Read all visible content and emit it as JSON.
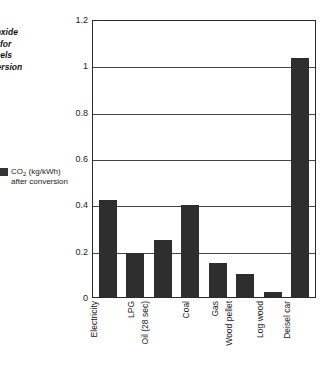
{
  "chart_data": {
    "type": "bar",
    "title": "Carbon dioxide emissions for different fuels after conversion",
    "xlabel": "",
    "ylabel": "",
    "ylim": [
      0,
      1.2
    ],
    "yticks": [
      "0",
      "0.2",
      "0.4",
      "0.6",
      "0.8",
      "1",
      "1.2"
    ],
    "ytick_values": [
      0,
      0.2,
      0.4,
      0.6,
      0.8,
      1,
      1.2
    ],
    "grid": "horizontal",
    "legend_position": "left",
    "categories": [
      "Electricity",
      "LPG",
      "Oil (28 sec)",
      "Coal",
      "Gas",
      "Wood pellet",
      "Log wood",
      "Deisel car"
    ],
    "values": [
      0.42,
      0.19,
      0.25,
      0.4,
      0.15,
      0.1,
      0.02,
      1.04
    ],
    "series": [
      {
        "name": "CO2 (kg/kWh) after conversion",
        "color": "#2e2e2e",
        "values": [
          0.42,
          0.19,
          0.25,
          0.4,
          0.15,
          0.1,
          0.02,
          1.04
        ]
      }
    ]
  },
  "caption": {
    "lines": [
      "Carbon dioxide",
      "emissions for",
      "different fuels",
      "after conversion"
    ]
  },
  "legend": {
    "label_main": "CO",
    "label_sub": "2",
    "label_units": " (kg/kWh)",
    "label_line2": "after conversion",
    "swatch_color": "#333333"
  },
  "axis": {
    "y_labels": [
      "1.2",
      "1",
      "0.8",
      "0.6",
      "0.4",
      "0.2",
      "0"
    ]
  }
}
